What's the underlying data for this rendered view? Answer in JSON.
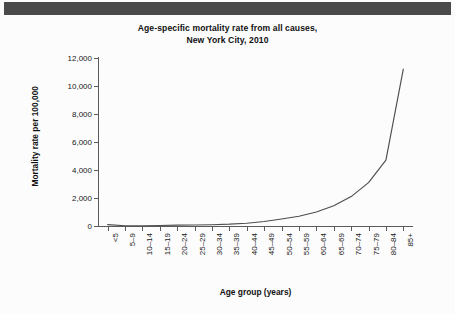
{
  "header": {
    "bar_color": "#4a4a4a"
  },
  "chart_data": {
    "type": "line",
    "title": "Age-specific mortality rate from all causes,",
    "title_line2": "New York City, 2010",
    "xlabel": "Age group (years)",
    "ylabel": "Mortality rate per 100,000",
    "categories": [
      "<5",
      "5–9",
      "10–14",
      "15–19",
      "20–24",
      "25–29",
      "30–34",
      "35–39",
      "40–44",
      "45–49",
      "50–54",
      "55–59",
      "60–64",
      "65–69",
      "70–74",
      "75–79",
      "80–84",
      "85+"
    ],
    "values": [
      100,
      20,
      20,
      35,
      60,
      70,
      90,
      130,
      200,
      320,
      500,
      700,
      1000,
      1450,
      2100,
      3100,
      4700,
      11200
    ],
    "ytick_labels": [
      "0",
      "2,000",
      "4,000",
      "6,000",
      "8,000",
      "10,000",
      "12,000"
    ],
    "ytick_values": [
      0,
      2000,
      4000,
      6000,
      8000,
      10000,
      12000
    ],
    "ylim": [
      0,
      12000
    ],
    "grid": false,
    "legend": false,
    "line_color": "#4d4d4d",
    "series_name": "All causes"
  }
}
